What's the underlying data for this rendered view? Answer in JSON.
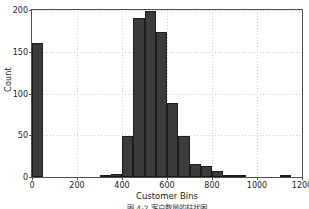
{
  "chart_data": {
    "type": "bar",
    "title": "",
    "subtitle": "",
    "xlabel": "Customer Bins",
    "ylabel": "Count",
    "xlim": [
      0,
      1200
    ],
    "ylim": [
      0,
      200
    ],
    "xticks": [
      0,
      200,
      400,
      600,
      800,
      1000,
      1200
    ],
    "xtick_labels": [
      "0",
      "200",
      "400",
      "600",
      "800",
      "1000",
      "1200"
    ],
    "yticks": [
      0,
      50,
      100,
      150,
      200
    ],
    "ytick_labels": [
      "0",
      "50",
      "100",
      "150",
      "200"
    ],
    "grid": true,
    "grid_style": "dotted",
    "legend": false,
    "bin_width": 50,
    "bar_color": "#3b3b3b",
    "bar_edge_color": "#1c1c1c",
    "bin_edges": [
      0,
      50,
      100,
      150,
      200,
      250,
      300,
      350,
      400,
      450,
      500,
      550,
      600,
      650,
      700,
      750,
      800,
      850,
      900,
      950,
      1000,
      1050,
      1100,
      1150,
      1200
    ],
    "categories": [
      "0-50",
      "50-100",
      "100-150",
      "150-200",
      "200-250",
      "250-300",
      "300-350",
      "350-400",
      "400-450",
      "450-500",
      "500-550",
      "550-600",
      "600-650",
      "650-700",
      "700-750",
      "750-800",
      "800-850",
      "850-900",
      "900-950",
      "950-1000",
      "1000-1050",
      "1050-1100",
      "1100-1150",
      "1150-1200"
    ],
    "values": [
      160,
      0,
      0,
      0,
      0,
      0,
      2,
      4,
      49,
      191,
      199,
      174,
      89,
      49,
      15,
      13,
      7,
      2,
      1,
      0,
      0,
      0,
      3,
      0
    ]
  },
  "caption": {
    "text": "图 4-2  客户数量的柱状图"
  },
  "axis": {
    "ylabel": "Count",
    "xlabel": "Customer Bins"
  }
}
